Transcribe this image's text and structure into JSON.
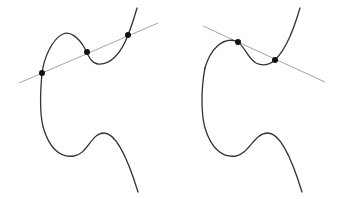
{
  "diagram": {
    "type": "elliptic-curve-illustration",
    "colors": {
      "curve": "#333333",
      "line": "#9a9a9a",
      "point": "#111111",
      "background": "#ffffff"
    },
    "panels": [
      {
        "id": "left",
        "description": "Elliptic curve with a secant line intersecting at three points",
        "line": {
          "x1": 19,
          "y1": 83,
          "x2": 158,
          "y2": 23
        },
        "points": [
          {
            "x": 42,
            "y": 73
          },
          {
            "x": 87,
            "y": 52
          },
          {
            "x": 128,
            "y": 35
          }
        ],
        "curve_upper": "M137,8 C133,22 130,30 128,35 C121,54 110,65 98,64 C90,63 88,54 84,47 C78,37 70,31 63,34 C52,39 44,58 42,73",
        "curve_lower": "M42,73 C40,95 40,118 44,130 C50,148 60,158 74,156 C88,154 91,133 104,133 C118,133 130,166 138,192"
      },
      {
        "id": "right",
        "description": "Elliptic curve with a tangent line touching at one point and crossing at another",
        "line": {
          "x1": 203,
          "y1": 26,
          "x2": 325,
          "y2": 82
        },
        "points": [
          {
            "x": 238,
            "y": 42
          },
          {
            "x": 275,
            "y": 60
          }
        ],
        "curve_upper": "M300,8 C294,28 287,48 275,60 C268,66 262,66 256,63 C247,58 244,44 236,41 C222,37 210,50 205,68",
        "curve_lower": "M205,68 C201,88 201,114 205,128 C211,148 222,158 236,156 C250,153 254,133 268,133 C282,133 294,166 302,192"
      }
    ]
  }
}
